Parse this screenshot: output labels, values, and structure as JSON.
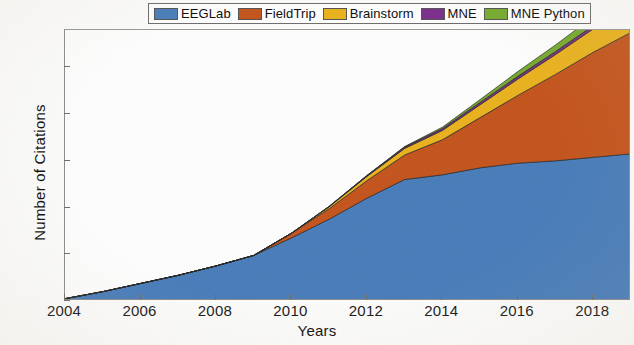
{
  "chart_data": {
    "type": "area",
    "stacked": true,
    "title": "",
    "xlabel": "Years",
    "ylabel": "Number of Citations",
    "xlim": [
      2004,
      2019
    ],
    "ylim": [
      0,
      1160
    ],
    "xticks": [
      2004,
      2006,
      2008,
      2010,
      2012,
      2014,
      2016,
      2018
    ],
    "xtick_labels": [
      "2004",
      "2006",
      "2008",
      "2010",
      "2012",
      "2014",
      "2016",
      "2018"
    ],
    "yticks": [
      0,
      200,
      400,
      600,
      800,
      1000
    ],
    "ytick_labels": [
      "0",
      "200",
      "400",
      "600",
      "800",
      "1000"
    ],
    "grid": false,
    "legend_position": "top-center",
    "x": [
      2004,
      2005,
      2006,
      2007,
      2008,
      2009,
      2010,
      2011,
      2012,
      2013,
      2014,
      2015,
      2016,
      2017,
      2018,
      2019
    ],
    "series": [
      {
        "name": "EEGLab",
        "color": "#4a7ebb",
        "values": [
          10,
          40,
          75,
          110,
          150,
          195,
          270,
          350,
          440,
          520,
          540,
          570,
          590,
          600,
          615,
          630
        ]
      },
      {
        "name": "FieldTrip",
        "color": "#c5561f",
        "values": [
          0,
          0,
          0,
          0,
          0,
          0,
          20,
          45,
          75,
          105,
          150,
          215,
          290,
          370,
          450,
          520
        ]
      },
      {
        "name": "Brainstorm",
        "color": "#eab320",
        "values": [
          0,
          0,
          0,
          0,
          0,
          0,
          0,
          8,
          18,
          28,
          40,
          55,
          70,
          85,
          100,
          110
        ]
      },
      {
        "name": "MNE",
        "color": "#7c2f8c",
        "values": [
          0,
          0,
          0,
          0,
          0,
          0,
          0,
          2,
          4,
          6,
          8,
          10,
          12,
          13,
          14,
          15
        ]
      },
      {
        "name": "MNE Python",
        "color": "#77ac30",
        "values": [
          0,
          0,
          0,
          0,
          0,
          0,
          0,
          0,
          0,
          2,
          6,
          12,
          20,
          28,
          38,
          45
        ]
      }
    ],
    "legend": [
      {
        "label": "EEGLab",
        "color": "#4a7ebb"
      },
      {
        "label": "FieldTrip",
        "color": "#c5561f"
      },
      {
        "label": "Brainstorm",
        "color": "#eab320"
      },
      {
        "label": "MNE",
        "color": "#7c2f8c"
      },
      {
        "label": "MNE Python",
        "color": "#77ac30"
      }
    ]
  }
}
